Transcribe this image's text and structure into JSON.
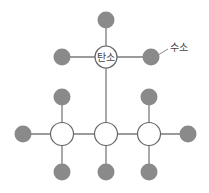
{
  "diagram": {
    "type": "molecular-structure",
    "colors": {
      "hydrogen_fill": "#8a8a8a",
      "carbon_fill": "#ffffff",
      "carbon_stroke": "#666666",
      "bond": "#7a7a7a",
      "label_text": "#444444"
    },
    "labels": {
      "carbon": "탄소",
      "hydrogen": "수소"
    },
    "atoms": {
      "carbons": [
        {
          "id": "c-top",
          "x": 106,
          "y": 57,
          "labeled": true
        },
        {
          "id": "c-left",
          "x": 62,
          "y": 134
        },
        {
          "id": "c-mid",
          "x": 106,
          "y": 134
        },
        {
          "id": "c-right",
          "x": 149,
          "y": 134
        }
      ],
      "hydrogens": [
        {
          "id": "h-top",
          "x": 106,
          "y": 20
        },
        {
          "id": "h-top-left",
          "x": 62,
          "y": 57
        },
        {
          "id": "h-top-right",
          "x": 151,
          "y": 57,
          "labeled": true
        },
        {
          "id": "h-left-up",
          "x": 62,
          "y": 97
        },
        {
          "id": "h-right-up",
          "x": 149,
          "y": 97
        },
        {
          "id": "h-left-end",
          "x": 23,
          "y": 134
        },
        {
          "id": "h-right-end",
          "x": 188,
          "y": 134
        },
        {
          "id": "h-left-down",
          "x": 62,
          "y": 172
        },
        {
          "id": "h-mid-down",
          "x": 106,
          "y": 172
        },
        {
          "id": "h-right-down",
          "x": 149,
          "y": 172
        }
      ]
    }
  }
}
